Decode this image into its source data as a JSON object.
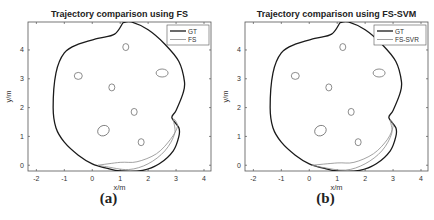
{
  "chart_data": [
    {
      "type": "line",
      "panel_label": "(a)",
      "title": "Trajectory comparison using FS",
      "xlabel": "x/m",
      "ylabel": "y/m",
      "xlim": [
        -2.3,
        4.25
      ],
      "ylim": [
        -0.2,
        4.97
      ],
      "xticks": [
        -2,
        -1,
        0,
        1,
        2,
        3,
        4
      ],
      "yticks": [
        0,
        1,
        2,
        3,
        4
      ],
      "grid": false,
      "legend": {
        "position": "upper right",
        "entries": [
          "GT",
          "FS"
        ]
      },
      "series": [
        {
          "name": "GT",
          "style": "thick dark line",
          "points": [
            [
              1.1,
              4.95
            ],
            [
              0.8,
              4.55
            ],
            [
              0.2,
              4.4
            ],
            [
              -0.5,
              4.2
            ],
            [
              -1.0,
              3.9
            ],
            [
              -1.3,
              3.2
            ],
            [
              -1.4,
              2.0
            ],
            [
              -1.3,
              1.3
            ],
            [
              -1.0,
              0.8
            ],
            [
              -0.5,
              0.35
            ],
            [
              0.0,
              0.05
            ],
            [
              0.5,
              -0.1
            ],
            [
              1.0,
              -0.2
            ],
            [
              1.8,
              -0.18
            ],
            [
              2.4,
              0.05
            ],
            [
              2.9,
              0.5
            ],
            [
              3.1,
              1.0
            ],
            [
              3.1,
              1.3
            ],
            [
              2.85,
              1.65
            ],
            [
              3.0,
              1.9
            ],
            [
              3.25,
              2.5
            ],
            [
              3.3,
              2.9
            ],
            [
              3.1,
              3.6
            ],
            [
              2.6,
              4.2
            ],
            [
              2.0,
              4.7
            ],
            [
              1.4,
              4.97
            ],
            [
              1.1,
              4.95
            ]
          ]
        },
        {
          "name": "FS",
          "style": "thin gray line",
          "points": [
            [
              0.2,
              0.0
            ],
            [
              1.0,
              0.1
            ],
            [
              1.6,
              0.12
            ],
            [
              2.3,
              0.4
            ],
            [
              2.8,
              0.9
            ],
            [
              3.05,
              1.35
            ],
            [
              2.9,
              1.6
            ],
            [
              2.95,
              1.1
            ],
            [
              2.6,
              0.5
            ],
            [
              2.0,
              0.05
            ],
            [
              1.3,
              -0.15
            ],
            [
              0.5,
              -0.05
            ],
            [
              0.2,
              0.0
            ]
          ]
        }
      ],
      "landmarks": [
        [
          1.2,
          4.1
        ],
        [
          -0.5,
          3.1
        ],
        [
          2.5,
          3.2
        ],
        [
          0.7,
          2.7
        ],
        [
          1.5,
          1.85
        ],
        [
          0.4,
          1.2
        ],
        [
          1.75,
          0.8
        ]
      ]
    },
    {
      "type": "line",
      "panel_label": "(b)",
      "title": "Trajectory comparison using FS-SVM",
      "xlabel": "x/m",
      "ylabel": "y/m",
      "xlim": [
        -2.3,
        4.25
      ],
      "ylim": [
        -0.2,
        4.97
      ],
      "xticks": [
        -2,
        -1,
        0,
        1,
        2,
        3,
        4
      ],
      "yticks": [
        0,
        1,
        2,
        3,
        4
      ],
      "grid": false,
      "legend": {
        "position": "upper right",
        "entries": [
          "GT",
          "FS-SVR"
        ]
      },
      "series": [
        {
          "name": "GT",
          "style": "thick dark line",
          "points": [
            [
              1.1,
              4.95
            ],
            [
              0.8,
              4.55
            ],
            [
              0.2,
              4.4
            ],
            [
              -0.5,
              4.2
            ],
            [
              -1.0,
              3.9
            ],
            [
              -1.3,
              3.2
            ],
            [
              -1.4,
              2.0
            ],
            [
              -1.3,
              1.3
            ],
            [
              -1.0,
              0.8
            ],
            [
              -0.5,
              0.35
            ],
            [
              0.0,
              0.05
            ],
            [
              0.5,
              -0.1
            ],
            [
              1.0,
              -0.2
            ],
            [
              1.8,
              -0.18
            ],
            [
              2.4,
              0.05
            ],
            [
              2.9,
              0.5
            ],
            [
              3.1,
              1.0
            ],
            [
              3.1,
              1.3
            ],
            [
              2.85,
              1.65
            ],
            [
              3.0,
              1.9
            ],
            [
              3.25,
              2.5
            ],
            [
              3.3,
              2.9
            ],
            [
              3.1,
              3.6
            ],
            [
              2.6,
              4.2
            ],
            [
              2.0,
              4.7
            ],
            [
              1.4,
              4.97
            ],
            [
              1.1,
              4.95
            ]
          ]
        },
        {
          "name": "FS-SVR",
          "style": "thin gray line",
          "points": [
            [
              0.1,
              0.0
            ],
            [
              1.0,
              0.08
            ],
            [
              1.6,
              0.1
            ],
            [
              2.3,
              0.4
            ],
            [
              2.8,
              0.9
            ],
            [
              3.0,
              1.35
            ],
            [
              2.9,
              1.55
            ],
            [
              2.95,
              1.1
            ],
            [
              2.6,
              0.5
            ],
            [
              2.0,
              0.05
            ],
            [
              1.3,
              -0.17
            ],
            [
              0.5,
              -0.08
            ],
            [
              0.1,
              0.0
            ]
          ]
        }
      ],
      "landmarks": [
        [
          1.2,
          4.1
        ],
        [
          -0.5,
          3.1
        ],
        [
          2.5,
          3.2
        ],
        [
          0.7,
          2.7
        ],
        [
          1.5,
          1.85
        ],
        [
          0.4,
          1.2
        ],
        [
          1.75,
          0.8
        ]
      ]
    }
  ],
  "panels": [
    {
      "title": "Trajectory comparison using FS",
      "caption": "(a)",
      "xlabel": "x/m",
      "ylabel": "y/m",
      "legend": [
        "GT",
        "FS"
      ]
    },
    {
      "title": "Trajectory comparison using FS-SVM",
      "caption": "(b)",
      "xlabel": "x/m",
      "ylabel": "y/m",
      "legend": [
        "GT",
        "FS-SVR"
      ]
    }
  ],
  "colors": {
    "gt": "#1a1a1a",
    "est": "#8a8a8a",
    "landmark": "#707070",
    "axis": "#555555"
  }
}
